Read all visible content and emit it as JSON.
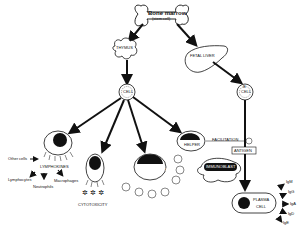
{
  "diagram": {
    "nodes": {
      "bone_marrow": {
        "title": "Bone marrow",
        "subtitle": "(stem cell)"
      },
      "thymus": {
        "label": "THYMUS"
      },
      "fetal_liver": {
        "label": "FETAL LIVER"
      },
      "t_cell": {
        "label": "T CELL",
        "short": "T",
        "text": "CELL"
      },
      "b_cell": {
        "label": "B CELL",
        "short": "B",
        "text": "CELL"
      },
      "lymphokines": {
        "label": "LYMPHOKINES"
      },
      "other_cells": {
        "label": "Other cells"
      },
      "lymphocytes": {
        "label": "Lymphocytes"
      },
      "neutrophils": {
        "label": "Neutrophils"
      },
      "macrophages": {
        "label": "Macrophages"
      },
      "cytotoxicity": {
        "label": "CYTOTOXICITY"
      },
      "suppressor": {
        "label": "SUPPRESSOR"
      },
      "helper": {
        "label": "HELPER"
      },
      "facilitation": {
        "label": "FACILITATION"
      },
      "antigen": {
        "label": "ANTIGEN"
      },
      "immunoblast": {
        "label": "IMMUNOBLAST"
      },
      "plasma_cell": {
        "label": "PLASMA CELL",
        "line1": "PLASMA",
        "line2": "CELL"
      }
    },
    "immunoglobulins": [
      "IgM",
      "IgG",
      "IgA",
      "IgD",
      "IgE"
    ],
    "colors": {
      "ink": "#111111",
      "background": "#ffffff"
    }
  }
}
